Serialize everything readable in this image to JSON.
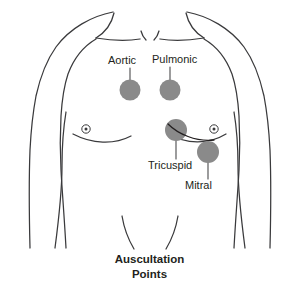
{
  "figure": {
    "title_line_1": "Auscultation",
    "title_line_2": "Points",
    "view": "anterior"
  },
  "colors": {
    "point_fill": "#8a8a8a",
    "outline": "#3a3a3c",
    "text": "#231f20",
    "background": "#ffffff",
    "leader_line": "#4a4a4c"
  },
  "points": [
    {
      "id": "aortic",
      "label": "Aortic",
      "label_position": "above",
      "cx": 130,
      "cy": 90,
      "r": 10.5,
      "leader": {
        "x1": 130,
        "y1": 68,
        "x2": 130,
        "y2": 82
      }
    },
    {
      "id": "pulmonic",
      "label": "Pulmonic",
      "label_position": "above",
      "cx": 170,
      "cy": 90,
      "r": 10.5,
      "leader": {
        "x1": 170,
        "y1": 67,
        "x2": 170,
        "y2": 82
      }
    },
    {
      "id": "tricuspid",
      "label": "Tricuspid",
      "label_position": "below-left",
      "cx": 176,
      "cy": 130,
      "r": 11.0,
      "leader": {
        "x1": 176,
        "y1": 140,
        "x2": 176,
        "y2": 159
      }
    },
    {
      "id": "mitral",
      "label": "Mitral",
      "label_position": "below-right",
      "cx": 208,
      "cy": 152,
      "r": 11.0,
      "leader": {
        "x1": 208,
        "y1": 162,
        "x2": 208,
        "y2": 179
      }
    }
  ],
  "landmarks": [
    {
      "id": "nipple-left",
      "cx": 86,
      "cy": 129,
      "r_outer": 4.2,
      "r_inner": 1.5
    },
    {
      "id": "nipple-right",
      "cx": 214,
      "cy": 129,
      "r_outer": 4.2,
      "r_inner": 1.5
    }
  ]
}
